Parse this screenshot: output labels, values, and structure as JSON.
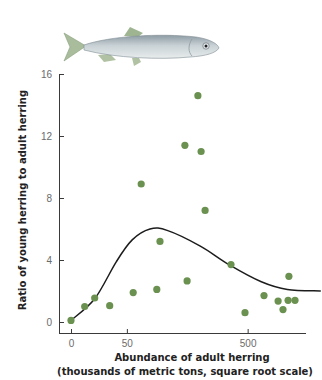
{
  "figure": {
    "illustration": "herring-fish-icon",
    "colors": {
      "point": "#6b9150",
      "curve": "#1c1c1c",
      "axis": "#3a3a3a",
      "tick_label": "#6b6b6b",
      "fish_body": "#b9c4c9",
      "fish_fin": "#9fb592"
    }
  },
  "chart_data": {
    "type": "scatter",
    "title": "",
    "xlabel": "Abundance of adult herring",
    "xlabel_line2": "(thousands of metric tons, square root scale)",
    "ylabel": "Ratio of young herring to adult herring",
    "x_scale": "sqrt",
    "x_ticks": [
      0,
      50,
      500
    ],
    "x_tick_labels": [
      "0",
      "50",
      "500"
    ],
    "y_ticks": [
      0,
      4,
      8,
      12,
      16
    ],
    "y_tick_labels": [
      "0",
      "4",
      "8",
      "12",
      "16"
    ],
    "xlim": [
      0,
      1100
    ],
    "ylim": [
      0,
      16
    ],
    "grid": false,
    "legend": null,
    "series": [
      {
        "name": "Observations",
        "type": "scatter",
        "points": [
          {
            "x": 0,
            "y": 0.1
          },
          {
            "x": 3,
            "y": 1.0
          },
          {
            "x": 9,
            "y": 1.55
          },
          {
            "x": 24,
            "y": 1.05
          },
          {
            "x": 62,
            "y": 1.9
          },
          {
            "x": 79,
            "y": 8.9
          },
          {
            "x": 118,
            "y": 2.1
          },
          {
            "x": 127,
            "y": 5.2
          },
          {
            "x": 208,
            "y": 11.4
          },
          {
            "x": 216,
            "y": 2.65
          },
          {
            "x": 258,
            "y": 14.6
          },
          {
            "x": 271,
            "y": 11.0
          },
          {
            "x": 288,
            "y": 7.2
          },
          {
            "x": 410,
            "y": 3.7
          },
          {
            "x": 485,
            "y": 0.6
          },
          {
            "x": 597,
            "y": 1.7
          },
          {
            "x": 687,
            "y": 1.35
          },
          {
            "x": 720,
            "y": 0.8
          },
          {
            "x": 755,
            "y": 1.4
          },
          {
            "x": 761,
            "y": 2.95
          },
          {
            "x": 804,
            "y": 1.4
          }
        ]
      },
      {
        "name": "Fitted stock-recruitment curve",
        "type": "line",
        "points": [
          {
            "x": 0,
            "y": 0.1
          },
          {
            "x": 9,
            "y": 1.5
          },
          {
            "x": 33,
            "y": 3.9
          },
          {
            "x": 60,
            "y": 5.3
          },
          {
            "x": 100,
            "y": 6.0
          },
          {
            "x": 150,
            "y": 5.9
          },
          {
            "x": 268,
            "y": 4.9
          },
          {
            "x": 400,
            "y": 3.7
          },
          {
            "x": 580,
            "y": 2.6
          },
          {
            "x": 750,
            "y": 2.1
          },
          {
            "x": 1000,
            "y": 2.0
          }
        ]
      }
    ]
  }
}
